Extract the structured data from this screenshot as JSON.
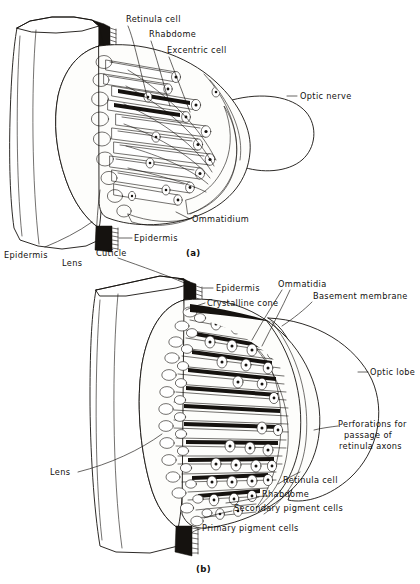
{
  "figure": {
    "background_color": "#ffffff",
    "ink_color": "#15120f",
    "tissue_fill": "#b9b7b2"
  },
  "panels": [
    {
      "id": "a",
      "caption": "(a)",
      "labels": [
        {
          "name": "retinula-cell",
          "text": "Retinula cell"
        },
        {
          "name": "rhabdome",
          "text": "Rhabdome"
        },
        {
          "name": "excentric-cell",
          "text": "Excentric cell"
        },
        {
          "name": "optic-nerve",
          "text": "Optic nerve"
        },
        {
          "name": "ommatidium",
          "text": "Ommatidium"
        },
        {
          "name": "epidermis-right",
          "text": "Epidermis"
        },
        {
          "name": "epidermis-left",
          "text": "Epidermis"
        },
        {
          "name": "lens",
          "text": "Lens"
        },
        {
          "name": "cuticle",
          "text": "Cuticle"
        }
      ]
    },
    {
      "id": "b",
      "caption": "(b)",
      "labels": [
        {
          "name": "epidermis",
          "text": "Epidermis"
        },
        {
          "name": "crystalline-cone",
          "text": "Crystalline cone"
        },
        {
          "name": "ommatidia",
          "text": "Ommatidia"
        },
        {
          "name": "basement-membrane",
          "text": "Basement membrane"
        },
        {
          "name": "optic-lobe",
          "text": "Optic lobe"
        },
        {
          "name": "perforations-line-1",
          "text": "Perforations for"
        },
        {
          "name": "perforations-line-2",
          "text": "passage of"
        },
        {
          "name": "perforations-line-3",
          "text": "retinula axons"
        },
        {
          "name": "retinula-cell",
          "text": "Retinula cell"
        },
        {
          "name": "rhabdome",
          "text": "Rhabdome"
        },
        {
          "name": "secondary-pigment-cells",
          "text": "Secondary pigment cells"
        },
        {
          "name": "primary-pigment-cells",
          "text": "Primary pigment cells"
        },
        {
          "name": "lens",
          "text": "Lens"
        }
      ]
    }
  ]
}
